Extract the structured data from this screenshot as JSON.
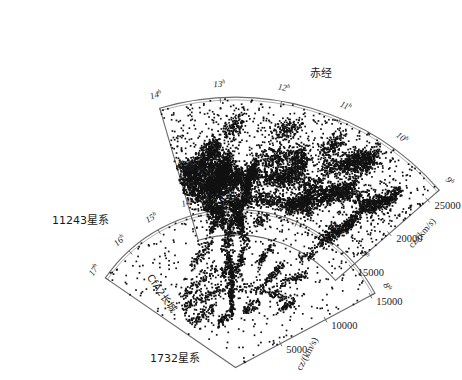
{
  "figure": {
    "title_ra": "赤经",
    "top_wedge": {
      "name": "SDSS slice",
      "count_label": "11243星系",
      "wall_label": "斯隆长城",
      "cz_axis_label": "cz/(km/s)",
      "hour_labels": [
        "14",
        "13",
        "12",
        "11",
        "10",
        "9"
      ],
      "cz_ticks": [
        "15000",
        "20000",
        "25000"
      ],
      "galaxy_count": 11243
    },
    "bottom_wedge": {
      "name": "CfA2 slice",
      "count_label": "1732星系",
      "wall_label": "CfA2长城",
      "cz_axis_label": "cz/(km/s)",
      "hour_labels": [
        "17",
        "16",
        "15",
        "14",
        "13",
        "12",
        "11",
        "10",
        "9",
        "8"
      ],
      "cz_ticks": [
        "5000",
        "10000",
        "15000"
      ],
      "galaxy_count": 1732
    },
    "hour_superscript": "h",
    "colors": {
      "outline": "#6b6b6b",
      "point": "#121212",
      "background": "#ffffff",
      "text": "#1a1a1a"
    }
  },
  "chart_data": {
    "type": "scatter",
    "title": "赤经",
    "xlabel": "赤经",
    "ylabel": "cz/(km/s)",
    "projection": "polar-wedge",
    "grid": false,
    "legend": "none",
    "series": [
      {
        "name": "11243星系",
        "n_points": 11243,
        "ra_range_h": [
          9,
          14
        ],
        "cz_range": [
          13000,
          26500
        ],
        "cz_ticks": [
          15000,
          20000,
          25000
        ],
        "annotation": "斯隆长城"
      },
      {
        "name": "1732星系",
        "n_points": 1732,
        "ra_range_h": [
          8,
          17
        ],
        "cz_range": [
          0,
          15500
        ],
        "cz_ticks": [
          5000,
          10000,
          15000
        ],
        "annotation": "CfA2长城"
      }
    ]
  }
}
